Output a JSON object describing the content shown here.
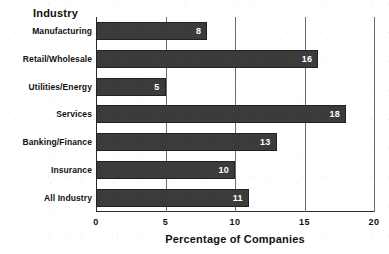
{
  "chart_data": {
    "type": "bar",
    "orientation": "horizontal",
    "title": "",
    "xlabel": "Percentage of Companies",
    "ylabel": "Industry",
    "xlim": [
      0,
      20
    ],
    "xticks": [
      "0",
      "5",
      "10",
      "15",
      "20"
    ],
    "xtick_values": [
      0,
      5,
      10,
      15,
      20
    ],
    "grid": "vertical",
    "legend": "none",
    "bar_color": "#3b3b3b",
    "value_label_color": "#ffffff",
    "categories": [
      "Manufacturing",
      "Retail/Wholesale",
      "Utilities/Energy",
      "Services",
      "Banking/Finance",
      "Insurance",
      "All Industry"
    ],
    "values": [
      8,
      16,
      5,
      18,
      13,
      10,
      11
    ],
    "value_labels": [
      "8",
      "16",
      "5",
      "18",
      "13",
      "10",
      "11"
    ]
  }
}
